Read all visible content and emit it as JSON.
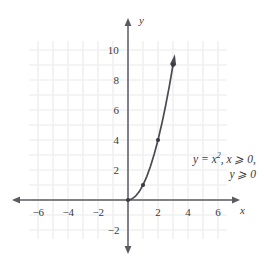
{
  "figure": {
    "background_color": "#ffffff",
    "axis_color": "#5a5a62",
    "grid_color": "#f0f0f2",
    "curve_color": "#4a4a52",
    "point_color": "#3a3a42",
    "text_color": "#3a3a3a"
  },
  "axes": {
    "x_name": "x",
    "y_name": "y",
    "x_ticks": [
      {
        "value": -6,
        "label": "−6"
      },
      {
        "value": -4,
        "label": "−4"
      },
      {
        "value": -2,
        "label": "−2"
      },
      {
        "value": 2,
        "label": "2"
      },
      {
        "value": 4,
        "label": "4"
      },
      {
        "value": 6,
        "label": "6"
      }
    ],
    "y_ticks": [
      {
        "value": 10,
        "label": "10"
      },
      {
        "value": 8,
        "label": "8"
      },
      {
        "value": 6,
        "label": "6"
      },
      {
        "value": 4,
        "label": "4"
      },
      {
        "value": 2,
        "label": "2"
      },
      {
        "value": -2,
        "label": "−2"
      }
    ]
  },
  "annotation": {
    "line1_prefix": "y = x",
    "line1_exponent": "2",
    "line1_suffix": ", x ⩾ 0,",
    "line2": "y ⩾ 0"
  },
  "chart_data": {
    "type": "line",
    "title": "",
    "xlabel": "x",
    "ylabel": "y",
    "xlim": [
      -7.2,
      7.2
    ],
    "ylim": [
      -3.0,
      11.0
    ],
    "grid": true,
    "grid_spacing": 1,
    "legend": "none",
    "annotations": [
      {
        "text": "y = x², x ⩾ 0, y ⩾ 0",
        "x": 4.2,
        "y": 2.3
      }
    ],
    "series": [
      {
        "name": "y = x^2, x ⩾ 0, y ⩾ 0",
        "type": "curve",
        "color": "#4a4a52",
        "arrow_end": true,
        "domain": [
          0,
          3
        ],
        "x": [
          0,
          0.25,
          0.5,
          0.75,
          1,
          1.25,
          1.5,
          1.75,
          2,
          2.25,
          2.5,
          2.75,
          3
        ],
        "y": [
          0,
          0.0625,
          0.25,
          0.5625,
          1,
          1.5625,
          2.25,
          3.0625,
          4,
          5.0625,
          6.25,
          7.5625,
          9
        ]
      }
    ],
    "marked_points": [
      {
        "x": 0,
        "y": 0
      },
      {
        "x": 1,
        "y": 1
      },
      {
        "x": 2,
        "y": 4
      },
      {
        "x": 3,
        "y": 9
      }
    ]
  }
}
